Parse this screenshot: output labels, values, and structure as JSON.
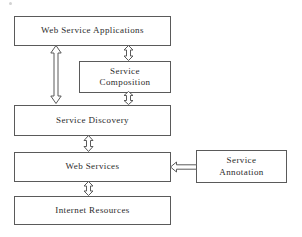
{
  "diagram": {
    "background_color": "#ffffff",
    "stroke_color": "#5a5a5a",
    "text_color": "#2b2b2b",
    "boxes": [
      {
        "id": "web-service-applications",
        "label": "Web Service Applications"
      },
      {
        "id": "service-composition",
        "label": "Service\nComposition"
      },
      {
        "id": "service-discovery",
        "label": "Service Discovery"
      },
      {
        "id": "web-services",
        "label": "Web Services"
      },
      {
        "id": "service-annotation",
        "label": "Service\nAnnotation"
      },
      {
        "id": "internet-resources",
        "label": "Internet Resources"
      }
    ],
    "arrows": [
      {
        "id": "apps-discovery",
        "from": "web-service-applications",
        "to": "service-discovery",
        "style": "double-headed-vertical",
        "length": 59
      },
      {
        "id": "apps-composition",
        "from": "web-service-applications",
        "to": "service-composition",
        "style": "double-headed-vertical",
        "length": 16
      },
      {
        "id": "composition-discovery",
        "from": "service-composition",
        "to": "service-discovery",
        "style": "double-headed-vertical",
        "length": 14
      },
      {
        "id": "discovery-services",
        "from": "service-discovery",
        "to": "web-services",
        "style": "double-headed-vertical",
        "length": 17
      },
      {
        "id": "services-internet",
        "from": "web-services",
        "to": "internet-resources",
        "style": "double-headed-vertical",
        "length": 15
      },
      {
        "id": "annotation-services",
        "from": "service-annotation",
        "to": "web-services",
        "style": "single-headed-left",
        "length": 26
      }
    ]
  }
}
